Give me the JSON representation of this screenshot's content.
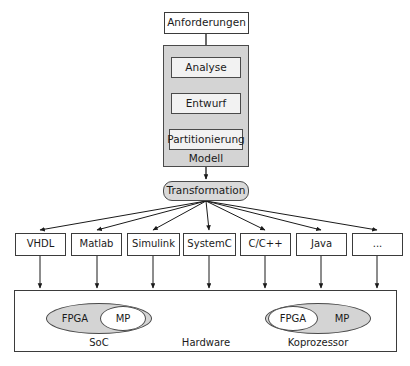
{
  "diagram": {
    "colors": {
      "group_fill": "#d4d4d4",
      "inner_fill": "#f2f2f2",
      "rounded_fill": "#d9d9d9",
      "stroke": "#3b3b3b",
      "background": "#ffffff"
    },
    "requirements": {
      "label": "Anforderungen"
    },
    "model_group": {
      "label": "Modell",
      "steps": [
        {
          "label": "Analyse"
        },
        {
          "label": "Entwurf"
        },
        {
          "label": "Partitionierung"
        }
      ]
    },
    "transformation": {
      "label": "Transformation"
    },
    "languages": [
      {
        "label": "VHDL"
      },
      {
        "label": "Matlab"
      },
      {
        "label": "Simulink"
      },
      {
        "label": "SystemC"
      },
      {
        "label": "C/C++"
      },
      {
        "label": "Java"
      },
      {
        "label": "..."
      }
    ],
    "hardware": {
      "label": "Hardware",
      "platforms": [
        {
          "name": "SoC",
          "label": "SoC",
          "outer_text": "FPGA",
          "inner_text": "MP"
        },
        {
          "name": "Koprozessor",
          "label": "Koprozessor",
          "outer_text": "MP",
          "inner_text": "FPGA"
        }
      ]
    }
  }
}
